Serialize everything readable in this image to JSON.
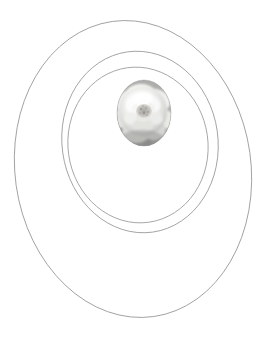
{
  "figure": {
    "background_color": "#ffffff",
    "width": 272,
    "height": 341,
    "stroke_color": "#9a9a9a",
    "stroke_width": 0.9
  },
  "shapes": {
    "outer_ellipse": {
      "name": "outer-ellipse",
      "cx": 133,
      "cy": 169,
      "rx": 118,
      "ry": 149,
      "rotation": -8,
      "stroke": "#9d9d9d",
      "fill": "none"
    },
    "middle_ellipse": {
      "name": "middle-ellipse",
      "cx": 140,
      "cy": 142,
      "rx": 78,
      "ry": 91,
      "rotation": -8,
      "stroke": "#a0a0a0",
      "fill": "none"
    },
    "inner_ellipse": {
      "name": "inner-ellipse",
      "cx": 138,
      "cy": 145,
      "rx": 70,
      "ry": 78,
      "rotation": -8,
      "stroke": "#a3a3a3",
      "fill": "none"
    },
    "photo_oval": {
      "name": "flower-photo-oval",
      "cx": 144,
      "cy": 113,
      "rx": 27,
      "ry": 33,
      "background": "#8f8f8f",
      "subject": "white rose bloom",
      "petal_color": "#f2f2f0",
      "shadow_color": "#8a8a8a",
      "center_color": "#b9b7b2"
    }
  },
  "labels": {
    "figure_label": "",
    "caption": ""
  }
}
